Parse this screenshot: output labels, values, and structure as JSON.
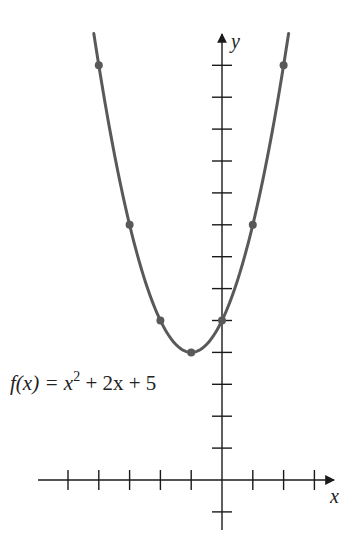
{
  "chart_data": {
    "type": "line",
    "title": "",
    "function_label": {
      "prefix": "f(x) = x",
      "exponent": "2",
      "suffix": " + 2x + 5"
    },
    "xlabel": "x",
    "ylabel": "y",
    "x_ticks": [
      -5,
      -4,
      -3,
      -2,
      -1,
      1,
      2,
      3
    ],
    "y_ticks": [
      -1,
      1,
      2,
      3,
      4,
      5,
      6,
      7,
      8,
      9,
      10,
      11,
      12,
      13
    ],
    "xlim": [
      -5.5,
      3.5
    ],
    "ylim": [
      -1.5,
      14.5
    ],
    "grid": false,
    "series": [
      {
        "name": "f(x) = x^2 + 2x + 5",
        "points": [
          {
            "x": -4,
            "y": 13
          },
          {
            "x": -3,
            "y": 8
          },
          {
            "x": -2,
            "y": 5
          },
          {
            "x": -1,
            "y": 4
          },
          {
            "x": 0,
            "y": 5
          },
          {
            "x": 1,
            "y": 8
          },
          {
            "x": 2,
            "y": 13
          }
        ],
        "color": "#595959"
      }
    ]
  }
}
